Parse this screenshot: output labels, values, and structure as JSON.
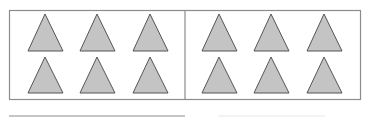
{
  "diagram": {
    "colors": {
      "border": "#8c8c8c",
      "triangle_fill": "#c4c4c4",
      "triangle_stroke": "#555555",
      "answer_line": "#8c8c8c",
      "faint_line": "#e6e6e6"
    },
    "groups": [
      {
        "name": "left-group",
        "triangle_count": 6,
        "rows": 2,
        "cols": 3
      },
      {
        "name": "right-group",
        "triangle_count": 6,
        "rows": 2,
        "cols": 3
      }
    ],
    "total_triangles": 12
  }
}
